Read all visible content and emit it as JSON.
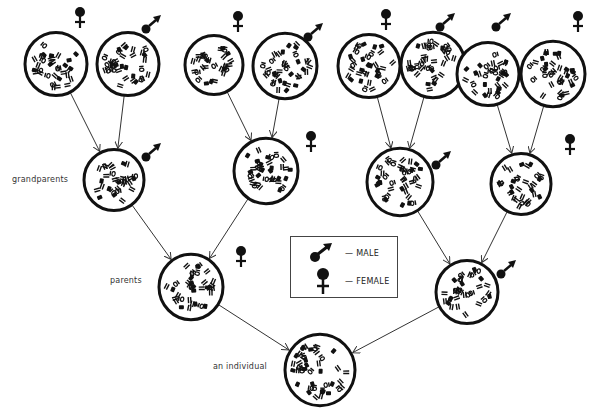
{
  "diagram": {
    "type": "ancestry-chromosome-tree",
    "generations": [
      {
        "key": "great_grandparents",
        "label": "",
        "cells": [
          {
            "id": "gg1",
            "sex": "female",
            "cx": 56,
            "cy": 64,
            "r": 31
          },
          {
            "id": "gg2",
            "sex": "male",
            "cx": 128,
            "cy": 64,
            "r": 31
          },
          {
            "id": "gg3",
            "sex": "female",
            "cx": 214,
            "cy": 65,
            "r": 29
          },
          {
            "id": "gg4",
            "sex": "male",
            "cx": 285,
            "cy": 66,
            "r": 32
          },
          {
            "id": "gg5",
            "sex": "female",
            "cx": 369,
            "cy": 66,
            "r": 31
          },
          {
            "id": "gg6",
            "sex": "male",
            "cx": 433,
            "cy": 65,
            "r": 32
          },
          {
            "id": "gg7",
            "sex": "male",
            "cx": 488,
            "cy": 74,
            "r": 31
          },
          {
            "id": "gg8",
            "sex": "female",
            "cx": 553,
            "cy": 74,
            "r": 32
          }
        ]
      },
      {
        "key": "grandparents",
        "label": "grandparents",
        "cells": [
          {
            "id": "g1",
            "sex": "male",
            "cx": 114,
            "cy": 180,
            "r": 30
          },
          {
            "id": "g2",
            "sex": "female",
            "cx": 266,
            "cy": 171,
            "r": 32
          },
          {
            "id": "g3",
            "sex": "male",
            "cx": 400,
            "cy": 182,
            "r": 33
          },
          {
            "id": "g4",
            "sex": "female",
            "cx": 521,
            "cy": 184,
            "r": 30
          }
        ]
      },
      {
        "key": "parents",
        "label": "parents",
        "cells": [
          {
            "id": "p1",
            "sex": "female",
            "cx": 191,
            "cy": 287,
            "r": 32
          },
          {
            "id": "p2",
            "sex": "male",
            "cx": 467,
            "cy": 292,
            "r": 31
          }
        ]
      },
      {
        "key": "individual",
        "label": "an individual",
        "cells": [
          {
            "id": "i1",
            "sex": "unknown",
            "cx": 320,
            "cy": 370,
            "r": 35
          }
        ]
      }
    ],
    "arrows": [
      {
        "from": "gg1",
        "to": "g1"
      },
      {
        "from": "gg2",
        "to": "g1"
      },
      {
        "from": "gg3",
        "to": "g2"
      },
      {
        "from": "gg4",
        "to": "g2"
      },
      {
        "from": "gg5",
        "to": "g3"
      },
      {
        "from": "gg6",
        "to": "g3"
      },
      {
        "from": "gg7",
        "to": "g4"
      },
      {
        "from": "gg8",
        "to": "g4"
      },
      {
        "from": "g1",
        "to": "p1"
      },
      {
        "from": "g2",
        "to": "p1"
      },
      {
        "from": "g3",
        "to": "p2"
      },
      {
        "from": "g4",
        "to": "p2"
      },
      {
        "from": "p1",
        "to": "i1"
      },
      {
        "from": "p2",
        "to": "i1"
      }
    ],
    "sex_symbols": [
      {
        "cell": "gg1",
        "sex": "female",
        "x": 80,
        "y": 8
      },
      {
        "cell": "gg2",
        "sex": "male",
        "x": 150,
        "y": 20
      },
      {
        "cell": "gg3",
        "sex": "female",
        "x": 238,
        "y": 12
      },
      {
        "cell": "gg4",
        "sex": "male",
        "x": 312,
        "y": 28
      },
      {
        "cell": "gg5",
        "sex": "female",
        "x": 386,
        "y": 10
      },
      {
        "cell": "gg6",
        "sex": "male",
        "x": 444,
        "y": 18
      },
      {
        "cell": "gg7",
        "sex": "male",
        "x": 500,
        "y": 18
      },
      {
        "cell": "gg8",
        "sex": "female",
        "x": 578,
        "y": 12
      },
      {
        "cell": "g1",
        "sex": "male",
        "x": 150,
        "y": 148
      },
      {
        "cell": "g2",
        "sex": "female",
        "x": 311,
        "y": 132
      },
      {
        "cell": "g3",
        "sex": "male",
        "x": 440,
        "y": 156
      },
      {
        "cell": "g4",
        "sex": "female",
        "x": 570,
        "y": 135
      },
      {
        "cell": "p1",
        "sex": "female",
        "x": 241,
        "y": 247
      },
      {
        "cell": "p2",
        "sex": "male",
        "x": 505,
        "y": 265
      }
    ],
    "labels": {
      "grandparents": {
        "text": "grandparents",
        "x": 12,
        "y": 180
      },
      "parents": {
        "text": "parents",
        "x": 110,
        "y": 280
      },
      "individual": {
        "text": "an individual",
        "x": 213,
        "y": 366
      }
    },
    "legend": {
      "male_label": "— MALE",
      "female_label": "— FEMALE",
      "items": [
        {
          "symbol": "male-icon",
          "label": "— MALE"
        },
        {
          "symbol": "female-icon",
          "label": "— FEMALE"
        }
      ]
    },
    "colors": {
      "ink": "#111111",
      "arrow": "#333333",
      "background": "#ffffff",
      "label": "#333333"
    }
  }
}
